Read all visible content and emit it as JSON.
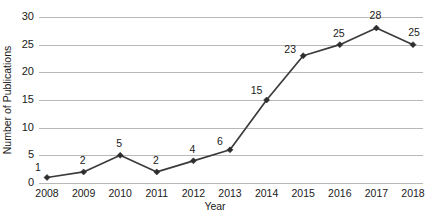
{
  "chart_data": {
    "type": "line",
    "title": "",
    "xlabel": "Year",
    "ylabel": "Number of Publications",
    "categories": [
      "2008",
      "2009",
      "2010",
      "2011",
      "2012",
      "2013",
      "2014",
      "2015",
      "2016",
      "2017",
      "2018"
    ],
    "x": [
      2008,
      2009,
      2010,
      2011,
      2012,
      2013,
      2014,
      2015,
      2016,
      2017,
      2018
    ],
    "values": [
      1,
      2,
      5,
      2,
      4,
      6,
      15,
      23,
      25,
      28,
      25
    ],
    "data_labels": [
      "1",
      "2",
      "5",
      "2",
      "4",
      "6",
      "15",
      "23",
      "25",
      "28",
      "25"
    ],
    "ylim": [
      0,
      30
    ],
    "yticks": [
      0,
      5,
      10,
      15,
      20,
      25,
      30
    ],
    "ytick_labels": [
      "0",
      "5",
      "10",
      "15",
      "20",
      "25",
      "30"
    ],
    "grid": true,
    "legend": "none",
    "series": [
      {
        "name": "Number of Publications",
        "values": [
          1,
          2,
          5,
          2,
          4,
          6,
          15,
          23,
          25,
          28,
          25
        ],
        "line_color": "#3b3b3b",
        "marker": "diamond",
        "marker_color": "#2e2e2e"
      }
    ],
    "colors": {
      "line": "#3b3b3b",
      "marker": "#2e2e2e",
      "gridline": "#b8b8b8",
      "text": "#1a1a1a",
      "background": "#ffffff"
    }
  }
}
